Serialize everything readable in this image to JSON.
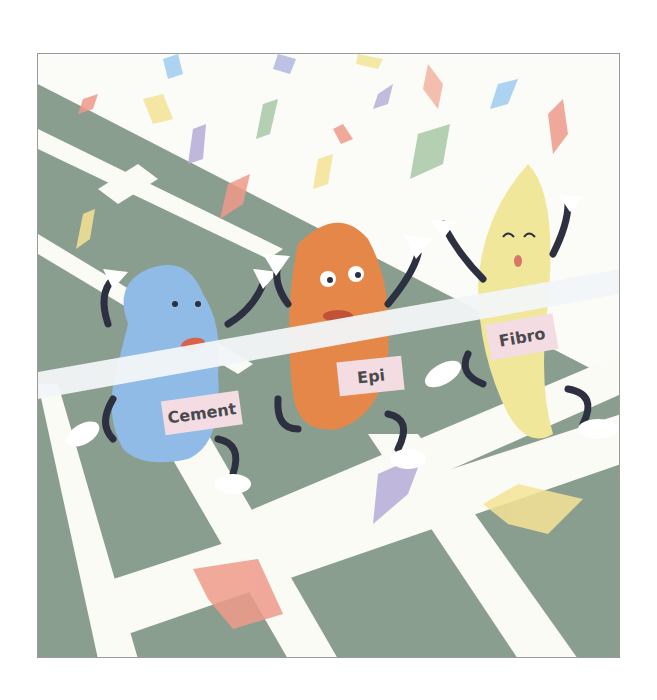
{
  "illustration": {
    "description": "Three cartoon characters crossing a finish line on a running track with confetti",
    "colors": {
      "track": "#8a9e90",
      "track_line": "#fbfbf6",
      "cement": "#8fbbe6",
      "epi": "#e6874a",
      "fibro": "#f1e79b",
      "bib": "#f3dde3",
      "tape": "#f2f6f8",
      "limbs": "#2c3040"
    },
    "characters": [
      {
        "name": "cement",
        "bib_label": "Cement"
      },
      {
        "name": "epi",
        "bib_label": "Epi"
      },
      {
        "name": "fibro",
        "bib_label": "Fibro"
      }
    ]
  }
}
